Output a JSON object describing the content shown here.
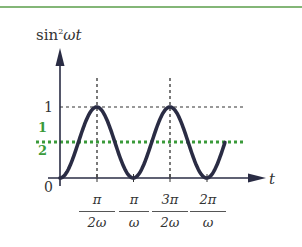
{
  "chart_data": {
    "type": "line",
    "title": "",
    "function": "sin^2(ωt)",
    "ylabel": "sin²ωt",
    "ylabel_base": "sin",
    "ylabel_sup": "2",
    "ylabel_rest": "ωt",
    "xlabel": "t",
    "origin_label": "0",
    "y_ticks": [
      {
        "value": 1,
        "label": "1"
      },
      {
        "value": 0.5,
        "label_num": "1",
        "label_den": "2",
        "highlight": true
      }
    ],
    "x_ticks": [
      {
        "value": "π/2ω",
        "num": "π",
        "den": "2ω"
      },
      {
        "value": "π/ω",
        "num": "π",
        "den": "ω"
      },
      {
        "value": "3π/2ω",
        "num": "3π",
        "den": "2ω"
      },
      {
        "value": "2π/ω",
        "num": "2π",
        "den": "ω"
      }
    ],
    "x_range_periods": [
      0,
      2.25
    ],
    "ylim": [
      0,
      1
    ],
    "reference_lines": [
      {
        "y": 1,
        "style": "dashed",
        "color": "#333333"
      },
      {
        "y": 0.5,
        "style": "dotted",
        "color": "#3a9a3a",
        "meaning": "average value 1/2"
      }
    ],
    "vertical_guides": [
      "π/2ω",
      "3π/2ω"
    ],
    "grid": false,
    "legend": null
  },
  "colors": {
    "curve": "#2a2c44",
    "axis": "#2a2c44",
    "average_line": "#3a9a3a",
    "top_rule": "#5a9e4a",
    "text": "#333333"
  }
}
